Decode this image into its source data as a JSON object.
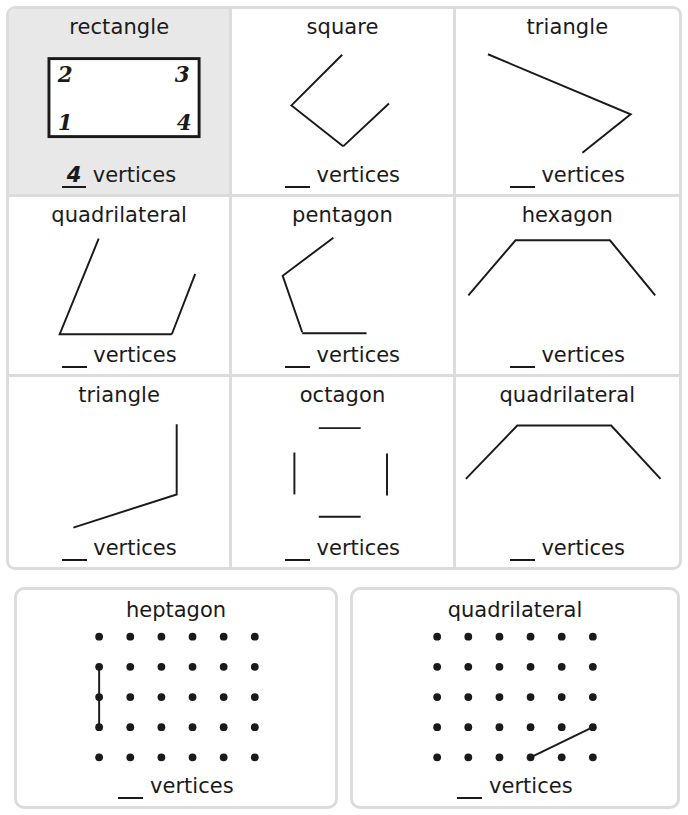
{
  "worksheet": {
    "vertices_label": "vertices",
    "blank_placeholder": "__",
    "ink_color": "#1a1a1a",
    "grid_line_color": "#dcdcdc",
    "highlight_color": "#e8e8e8"
  },
  "grid_cells": [
    {
      "name": "rectangle",
      "title": "rectangle",
      "answer": "4",
      "answer_label": "vertices",
      "highlighted": true,
      "shape_type": "rectangle-complete",
      "vertex_numbers": [
        "2",
        "3",
        "1",
        "4"
      ]
    },
    {
      "name": "square",
      "title": "square",
      "answer": "__",
      "answer_label": "vertices",
      "highlighted": false,
      "shape_type": "square-partial"
    },
    {
      "name": "triangle-1",
      "title": "triangle",
      "answer": "__",
      "answer_label": "vertices",
      "highlighted": false,
      "shape_type": "triangle-partial"
    },
    {
      "name": "quadrilateral-1",
      "title": "quadrilateral",
      "answer": "__",
      "answer_label": "vertices",
      "highlighted": false,
      "shape_type": "parallelogram-partial"
    },
    {
      "name": "pentagon",
      "title": "pentagon",
      "answer": "__",
      "answer_label": "vertices",
      "highlighted": false,
      "shape_type": "pentagon-partial"
    },
    {
      "name": "hexagon",
      "title": "hexagon",
      "answer": "__",
      "answer_label": "vertices",
      "highlighted": false,
      "shape_type": "hexagon-partial"
    },
    {
      "name": "triangle-2",
      "title": "triangle",
      "answer": "__",
      "answer_label": "vertices",
      "highlighted": false,
      "shape_type": "triangle-corner-partial"
    },
    {
      "name": "octagon",
      "title": "octagon",
      "answer": "__",
      "answer_label": "vertices",
      "highlighted": false,
      "shape_type": "octagon-segments"
    },
    {
      "name": "quadrilateral-2",
      "title": "quadrilateral",
      "answer": "__",
      "answer_label": "vertices",
      "highlighted": false,
      "shape_type": "trapezoid-partial"
    }
  ],
  "geoboards": [
    {
      "name": "heptagon-geoboard",
      "title": "heptagon",
      "answer": "__",
      "answer_label": "vertices",
      "grid_columns": 6,
      "grid_rows": 5,
      "drawn_segments": "vertical line, column 1 from row 2 to row 4"
    },
    {
      "name": "quadrilateral-geoboard",
      "title": "quadrilateral",
      "answer": "__",
      "answer_label": "vertices",
      "grid_columns": 6,
      "grid_rows": 5,
      "drawn_segments": "diagonal line, row 5 column 4 to row 4 column 6"
    }
  ]
}
